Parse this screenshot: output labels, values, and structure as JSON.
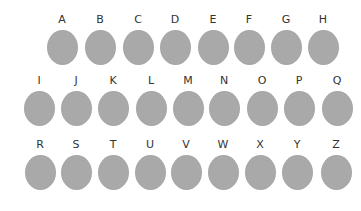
{
  "circle_color": "#a9a9a9",
  "rows": [
    {
      "items": [
        {
          "label": "A",
          "x": 62
        },
        {
          "label": "B",
          "x": 100
        },
        {
          "label": "C",
          "x": 138
        },
        {
          "label": "D",
          "x": 175
        },
        {
          "label": "E",
          "x": 213
        },
        {
          "label": "F",
          "x": 249
        },
        {
          "label": "G",
          "x": 286
        },
        {
          "label": "H",
          "x": 323
        }
      ]
    },
    {
      "items": [
        {
          "label": "I",
          "x": 39
        },
        {
          "label": "J",
          "x": 76
        },
        {
          "label": "K",
          "x": 113
        },
        {
          "label": "L",
          "x": 151
        },
        {
          "label": "M",
          "x": 188
        },
        {
          "label": "N",
          "x": 224
        },
        {
          "label": "O",
          "x": 262
        },
        {
          "label": "P",
          "x": 299
        },
        {
          "label": "Q",
          "x": 337
        }
      ]
    },
    {
      "items": [
        {
          "label": "R",
          "x": 40
        },
        {
          "label": "S",
          "x": 76
        },
        {
          "label": "T",
          "x": 113
        },
        {
          "label": "U",
          "x": 150
        },
        {
          "label": "V",
          "x": 186
        },
        {
          "label": "W",
          "x": 223
        },
        {
          "label": "X",
          "x": 260
        },
        {
          "label": "Y",
          "x": 297
        },
        {
          "label": "Z",
          "x": 336
        }
      ]
    }
  ]
}
